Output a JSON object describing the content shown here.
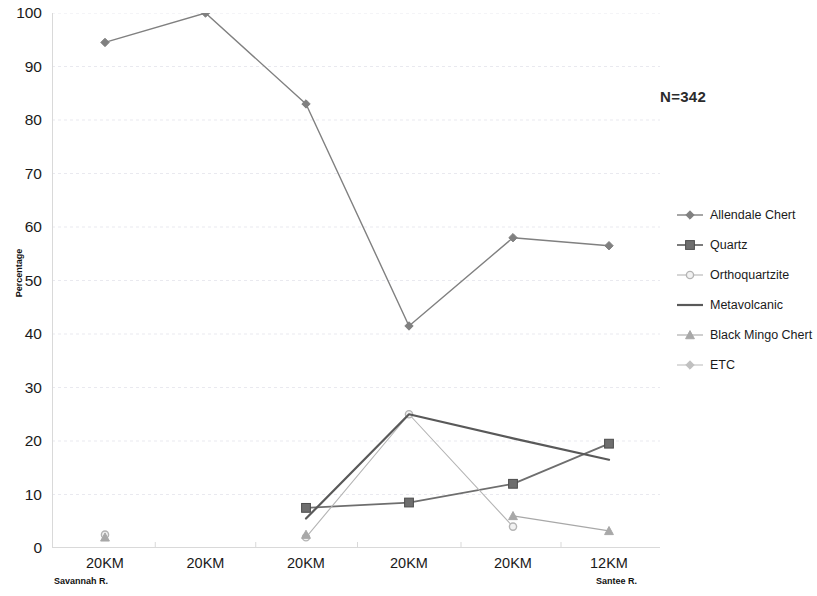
{
  "chart_data": {
    "type": "line",
    "title": "",
    "xlabel": "",
    "ylabel": "Percentage",
    "ylim": [
      0,
      100
    ],
    "ytick_step": 10,
    "yticks": [
      100,
      90,
      80,
      70,
      60,
      50,
      40,
      30,
      20,
      10,
      0
    ],
    "grid": true,
    "legend_position": "right",
    "annotation": "N=342",
    "categories": [
      "20KM",
      "20KM",
      "20KM",
      "20KM",
      "20KM",
      "12KM"
    ],
    "category_sublabels": {
      "first": "Savannah R.",
      "last": "Santee R."
    },
    "series": [
      {
        "name": "Allendale Chert",
        "marker": "diamond",
        "color": "#808080",
        "values": [
          94.5,
          100,
          83,
          41.5,
          58,
          56.5
        ]
      },
      {
        "name": "Quartz",
        "marker": "square",
        "color": "#6e6e6e",
        "values": [
          null,
          null,
          7.5,
          8.5,
          12,
          19.5
        ]
      },
      {
        "name": "Orthoquartzite",
        "marker": "circle",
        "color": "#b4b4b4",
        "values": [
          2.5,
          null,
          2,
          25,
          4,
          null
        ]
      },
      {
        "name": "Metavolcanic",
        "marker": "none",
        "color": "#595959",
        "values": [
          null,
          null,
          5.5,
          25,
          20.5,
          16.5
        ]
      },
      {
        "name": "Black Mingo Chert",
        "marker": "triangle",
        "color": "#a8a8a8",
        "values": [
          2,
          null,
          2.5,
          null,
          6,
          3.2
        ]
      },
      {
        "name": "ETC",
        "marker": "diamond",
        "color": "#c0c0c0",
        "values": [
          null,
          null,
          null,
          null,
          null,
          null
        ]
      }
    ]
  },
  "axis": {
    "y_title": "Percentage",
    "y_labels": [
      "100",
      "90",
      "80",
      "70",
      "60",
      "50",
      "40",
      "30",
      "20",
      "10",
      "0"
    ],
    "x_labels": [
      "20KM",
      "20KM",
      "20KM",
      "20KM",
      "20KM",
      "12KM"
    ],
    "x_sub_left": "Savannah R.",
    "x_sub_right": "Santee R."
  },
  "annotation": {
    "sample_size": "N=342"
  },
  "legend": {
    "items": [
      {
        "label": "Allendale Chert"
      },
      {
        "label": "Quartz"
      },
      {
        "label": "Orthoquartzite"
      },
      {
        "label": "Metavolcanic"
      },
      {
        "label": "Black Mingo Chert"
      },
      {
        "label": "ETC"
      }
    ]
  },
  "colors": {
    "grid": "#e9e9ef",
    "axis": "#d9d9d9",
    "text": "#1a1a1a",
    "series_allendale": "#808080",
    "series_quartz": "#6e6e6e",
    "series_orthoquartzite": "#b4b4b4",
    "series_metavolcanic": "#595959",
    "series_blackmingo": "#a8a8a8",
    "series_etc": "#c0c0c0"
  }
}
